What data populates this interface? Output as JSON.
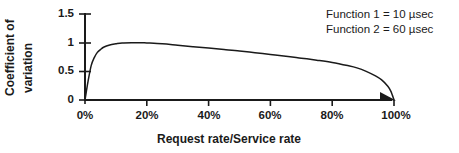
{
  "chart_data": {
    "type": "line",
    "title": "",
    "xlabel": "Request rate/Service rate",
    "ylabel_line1": "Coefficient of",
    "ylabel_line2": "variation",
    "xlim": [
      0,
      100
    ],
    "ylim": [
      0,
      1.5
    ],
    "grid": false,
    "xticks": [
      "0%",
      "20%",
      "40%",
      "60%",
      "80%",
      "100%"
    ],
    "xtick_values": [
      0,
      20,
      40,
      60,
      80,
      100
    ],
    "yticks": [
      "0",
      "0.5",
      "1",
      "1.5"
    ],
    "ytick_values": [
      0,
      0.5,
      1,
      1.5
    ],
    "legend_position": "top-right",
    "legend": [
      "Function 1 = 10 µsec",
      "Function 2 = 60 µsec"
    ],
    "series": [
      {
        "name": "Coefficient of variation",
        "x": [
          0,
          0.5,
          1,
          2,
          3,
          4,
          5,
          6,
          8,
          10,
          12,
          15,
          18,
          20,
          25,
          30,
          35,
          40,
          45,
          50,
          55,
          60,
          65,
          70,
          75,
          80,
          85,
          88,
          91,
          94,
          96,
          98,
          99,
          100
        ],
        "values": [
          0,
          0.17,
          0.33,
          0.6,
          0.74,
          0.83,
          0.88,
          0.92,
          0.96,
          0.98,
          0.995,
          1.0,
          1.0,
          0.995,
          0.98,
          0.955,
          0.93,
          0.905,
          0.88,
          0.855,
          0.825,
          0.795,
          0.765,
          0.73,
          0.695,
          0.655,
          0.6,
          0.56,
          0.5,
          0.42,
          0.35,
          0.24,
          0.15,
          0
        ]
      }
    ]
  },
  "axes": {
    "arrow_x_end": true
  }
}
